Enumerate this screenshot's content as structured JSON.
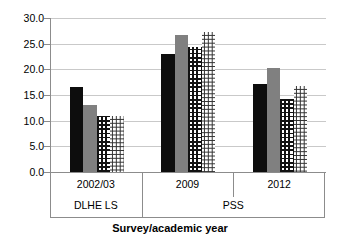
{
  "chart_data": {
    "type": "bar",
    "title": "",
    "xlabel": "Survey/academic year",
    "ylabel": "",
    "ylim": [
      0,
      30
    ],
    "ytick_labels": [
      "0.0",
      "5.0",
      "10.0",
      "15.0",
      "20.0",
      "25.0",
      "30.0"
    ],
    "ytick_values": [
      0,
      5,
      10,
      15,
      20,
      25,
      30
    ],
    "grid": true,
    "legend": "none",
    "categories": [
      "2002/03",
      "2009",
      "2012"
    ],
    "category_groups": [
      {
        "label": "DLHE LS",
        "categories": [
          "2002/03"
        ]
      },
      {
        "label": "PSS",
        "categories": [
          "2009",
          "2012"
        ]
      }
    ],
    "series": [
      {
        "name": "series-1",
        "pattern": "solid-black",
        "color": "#0d0d0d",
        "values": [
          16.5,
          23.0,
          17.2
        ]
      },
      {
        "name": "series-2",
        "pattern": "solid-gray",
        "color": "#808080",
        "values": [
          13.0,
          26.7,
          20.3
        ]
      },
      {
        "name": "series-3",
        "pattern": "cross-hatch",
        "color": "#121212",
        "values": [
          11.0,
          24.3,
          14.3
        ]
      },
      {
        "name": "series-4",
        "pattern": "fine-dots",
        "color": "#2b2b2b",
        "values": [
          11.0,
          27.3,
          16.7
        ]
      }
    ]
  },
  "axis": {
    "title": "Survey/academic year"
  },
  "style": {
    "gridline_color": "#c9c9c9",
    "axis_color": "#8c8c8c",
    "background": "#ffffff"
  }
}
